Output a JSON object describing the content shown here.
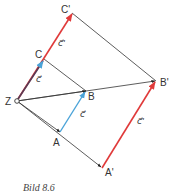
{
  "diagram": {
    "points": {
      "Z": {
        "label": "Z",
        "x": 17,
        "y": 101
      },
      "A": {
        "label": "A",
        "x": 60,
        "y": 132
      },
      "B": {
        "label": "B",
        "x": 86,
        "y": 91
      },
      "C": {
        "label": "C",
        "x": 44,
        "y": 59
      },
      "A_prime": {
        "label": "A'",
        "x": 102,
        "y": 168
      },
      "B_prime": {
        "label": "B'",
        "x": 156,
        "y": 81
      },
      "C_prime": {
        "label": "C'",
        "x": 72,
        "y": 13
      }
    },
    "vector_labels": {
      "c_AB": "c⃗",
      "c_ZC": "c⃗",
      "c_prime_CC": "c⃗'",
      "c_prime_AB": "c⃗'"
    },
    "colors": {
      "black_line": "#333333",
      "blue_vector": "#4aa3d8",
      "red_vector": "#e03a3a",
      "dark_vector": "#5a3a55"
    }
  },
  "caption": "Bild 8.6"
}
